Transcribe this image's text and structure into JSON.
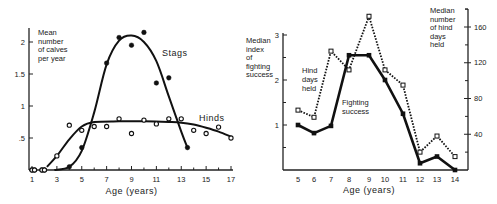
{
  "chart_data": [
    {
      "type": "scatter",
      "title": "",
      "xlabel": "Age (years)",
      "ylabel": "Mean number of calves per year",
      "ylabel_lines": [
        "Mean",
        "number",
        "of calves",
        "per year"
      ],
      "xlim": [
        0.8,
        17.2
      ],
      "ylim": [
        0,
        2.2
      ],
      "x_ticks": [
        1,
        3,
        5,
        7,
        9,
        11,
        13,
        15,
        17
      ],
      "x_minor_ticks": [
        1,
        2,
        3,
        4,
        5,
        6,
        7,
        8,
        9,
        10,
        11,
        12,
        13,
        14,
        15,
        16,
        17
      ],
      "y_ticks": [
        {
          "v": 0.5,
          "label": ".5"
        },
        {
          "v": 1,
          "label": "1"
        },
        {
          "v": 1.5,
          "label": "1.5"
        },
        {
          "v": 2,
          "label": "2"
        }
      ],
      "grid": false,
      "series": [
        {
          "name": "Stags",
          "marker": "filled-circle",
          "points": [
            [
              1,
              0
            ],
            [
              1.2,
              0
            ],
            [
              1.8,
              0
            ],
            [
              2,
              0
            ],
            [
              4,
              0.05
            ],
            [
              5,
              0.35
            ],
            [
              7,
              1.67
            ],
            [
              8,
              2.07
            ],
            [
              9,
              1.95
            ],
            [
              10,
              2.15
            ],
            [
              11,
              1.36
            ],
            [
              12,
              1.44
            ],
            [
              13.5,
              0.35
            ]
          ],
          "fit_curve": [
            [
              2.8,
              0
            ],
            [
              4,
              0.05
            ],
            [
              5,
              0.3
            ],
            [
              6,
              0.9
            ],
            [
              7,
              1.65
            ],
            [
              8,
              2.02
            ],
            [
              9,
              2.1
            ],
            [
              10,
              2.0
            ],
            [
              11,
              1.7
            ],
            [
              12,
              1.15
            ],
            [
              13,
              0.6
            ],
            [
              13.5,
              0.35
            ]
          ]
        },
        {
          "name": "Hinds",
          "marker": "open-circle",
          "points": [
            [
              1,
              0
            ],
            [
              1.2,
              0
            ],
            [
              1.8,
              0
            ],
            [
              2,
              0
            ],
            [
              3,
              0.22
            ],
            [
              4,
              0.7
            ],
            [
              5,
              0.62
            ],
            [
              6,
              0.68
            ],
            [
              7,
              0.68
            ],
            [
              8,
              0.8
            ],
            [
              9,
              0.57
            ],
            [
              10,
              0.78
            ],
            [
              11,
              0.72
            ],
            [
              12,
              0.8
            ],
            [
              13,
              0.8
            ],
            [
              14,
              0.62
            ],
            [
              15,
              0.57
            ],
            [
              16,
              0.67
            ],
            [
              17,
              0.5
            ]
          ],
          "fit_curve": [
            [
              2.2,
              0.05
            ],
            [
              3,
              0.22
            ],
            [
              4,
              0.48
            ],
            [
              5,
              0.68
            ],
            [
              6,
              0.75
            ],
            [
              8,
              0.76
            ],
            [
              10,
              0.76
            ],
            [
              12,
              0.75
            ],
            [
              13,
              0.74
            ],
            [
              14,
              0.71
            ],
            [
              15,
              0.66
            ],
            [
              16,
              0.6
            ],
            [
              17,
              0.52
            ]
          ]
        }
      ],
      "annotations": [
        "Stags",
        "Hinds"
      ]
    },
    {
      "type": "line",
      "title": "",
      "xlabel": "Age (years)",
      "ylabel": "Median index of fighting success",
      "ylabel_lines": [
        "Median",
        "index",
        "of",
        "fighting",
        "success"
      ],
      "y2label": "Median number of hind days held",
      "y2label_lines": [
        "Median",
        "number",
        "of hind",
        "days",
        "held"
      ],
      "categories": [
        5,
        6,
        7,
        8,
        9,
        10,
        11,
        12,
        13,
        14
      ],
      "ylim": [
        0,
        3.1
      ],
      "y_ticks": [
        1,
        2,
        3
      ],
      "y_minor_ticks": [
        0.5,
        1.5,
        2.5
      ],
      "y2lim": [
        0,
        180
      ],
      "y2_ticks": [
        40,
        80,
        120,
        160
      ],
      "y2_minor_ticks": [
        20,
        60,
        100,
        140,
        180
      ],
      "grid": false,
      "series": [
        {
          "name": "Fighting success",
          "axis": "left",
          "style": "solid-thick",
          "marker": "filled-square",
          "values": [
            1.0,
            0.82,
            0.98,
            2.55,
            2.55,
            2.0,
            1.25,
            0.15,
            0.3,
            0.0
          ]
        },
        {
          "name": "Hind days held",
          "axis": "right",
          "style": "dotted",
          "marker": "open-square",
          "values": [
            67,
            59,
            133,
            112,
            172,
            112,
            95,
            20,
            38,
            15
          ]
        }
      ],
      "annotations": [
        "Hind days held",
        "Fighting success"
      ]
    }
  ],
  "labels": {
    "left_ylabel": [
      "Mean",
      "number",
      "of calves",
      "per year"
    ],
    "stags": "Stags",
    "hinds": "Hinds",
    "left_xlabel": "Age  (years)",
    "right_ylabel": [
      "Median",
      "index",
      "of",
      "fighting",
      "success"
    ],
    "right_y2label": [
      "Median",
      "number",
      "of  hind",
      "days",
      "held"
    ],
    "hind_days": [
      "Hind",
      "days",
      "held"
    ],
    "fighting": [
      "Fighting",
      "success"
    ],
    "right_xlabel": "Age  (years)"
  }
}
